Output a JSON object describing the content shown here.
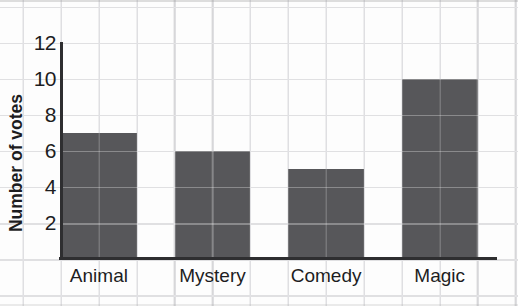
{
  "figure": {
    "background": "#fdfdfd",
    "grid_color": "#c9c9cc",
    "axis_color": "#2e2e30",
    "text_color": "#1d1d1f"
  },
  "chart_data": {
    "type": "bar",
    "title": "",
    "xlabel": "",
    "ylabel": "Number of votes",
    "categories": [
      "Animal",
      "Mystery",
      "Comedy",
      "Magic"
    ],
    "values": [
      7,
      6,
      5,
      10
    ],
    "yticks": [
      2,
      4,
      6,
      8,
      10,
      12
    ],
    "ylim": [
      0,
      13
    ],
    "grid": true,
    "legend": "none",
    "bar_color": "#57575a"
  }
}
